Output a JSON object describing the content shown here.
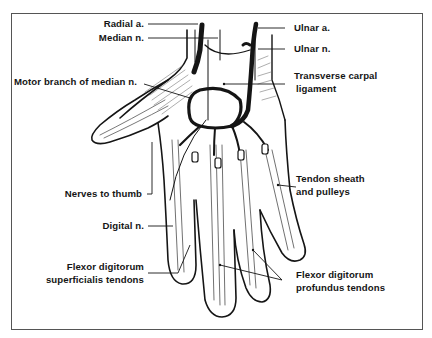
{
  "figure": {
    "labels": {
      "radial_a": "Radial a.",
      "median_n": "Median n.",
      "motor_branch": "Motor branch of median n.",
      "nerves_to_thumb": "Nerves to thumb",
      "digital_n": "Digital n.",
      "fds_line1": "Flexor digitorum",
      "fds_line2": "superficialis tendons",
      "ulnar_a": "Ulnar a.",
      "ulnar_n": "Ulnar n.",
      "tcl_line1": "Transverse carpal",
      "tcl_line2": "ligament",
      "sheath_line1": "Tendon sheath",
      "sheath_line2": "and pulleys",
      "fdp_line1": "Flexor digitorum",
      "fdp_line2": "profundus tendons"
    },
    "colors": {
      "ink": "#151515",
      "frame": "#555555",
      "background": "#ffffff",
      "hatch": "#777777"
    }
  }
}
